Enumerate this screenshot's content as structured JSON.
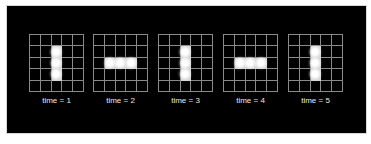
{
  "figure": {
    "title": "",
    "grid_size": 5,
    "colors": {
      "background": "#000000",
      "grid_line": "#8a8a8a",
      "live_cell": "#d4d4d4",
      "label": "#e8e8e8"
    },
    "frames": [
      {
        "label": "time = 1",
        "orientation": "vertical",
        "live_cells": [
          [
            1,
            2
          ],
          [
            2,
            2
          ],
          [
            3,
            2
          ]
        ]
      },
      {
        "label": "time = 2",
        "orientation": "horizontal",
        "live_cells": [
          [
            2,
            1
          ],
          [
            2,
            2
          ],
          [
            2,
            3
          ]
        ]
      },
      {
        "label": "time = 3",
        "orientation": "vertical",
        "live_cells": [
          [
            1,
            2
          ],
          [
            2,
            2
          ],
          [
            3,
            2
          ]
        ]
      },
      {
        "label": "time = 4",
        "orientation": "horizontal",
        "live_cells": [
          [
            2,
            1
          ],
          [
            2,
            2
          ],
          [
            2,
            3
          ]
        ]
      },
      {
        "label": "time = 5",
        "orientation": "vertical",
        "live_cells": [
          [
            1,
            2
          ],
          [
            2,
            2
          ],
          [
            3,
            2
          ]
        ]
      }
    ]
  }
}
